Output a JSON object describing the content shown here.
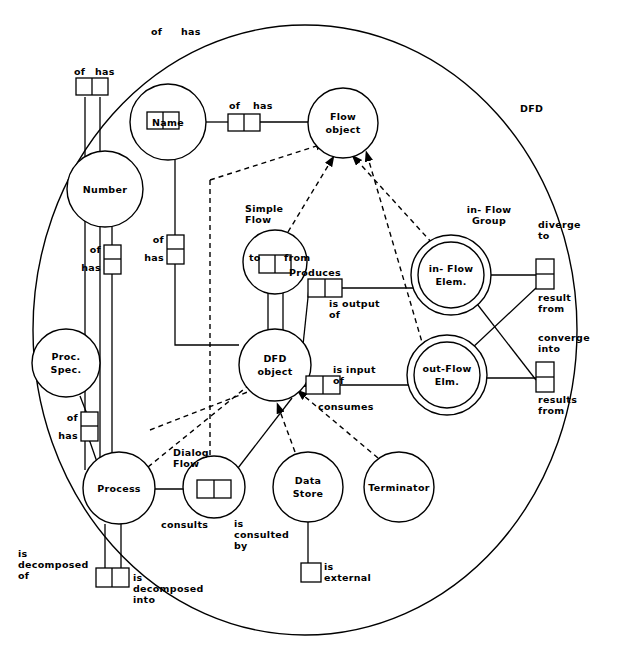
{
  "diagram": {
    "title": "DFD",
    "outer_label": "DFD",
    "entities": [
      {
        "id": "name",
        "label": "Name",
        "cx": 168,
        "cy": 122,
        "r": 38,
        "double": false
      },
      {
        "id": "number",
        "label": "Number",
        "cx": 105,
        "cy": 189,
        "r": 38,
        "double": false
      },
      {
        "id": "flow_object",
        "label": "Flow\nobject",
        "cx": 343,
        "cy": 123,
        "r": 35,
        "double": false
      },
      {
        "id": "simple_flow",
        "label": "to   from",
        "cx": 275,
        "cy": 262,
        "r": 32,
        "double": false
      },
      {
        "id": "dfd_object",
        "label": "DFD\nobject",
        "cx": 275,
        "cy": 365,
        "r": 36,
        "double": false
      },
      {
        "id": "in_flow",
        "label": "in- Flow\nElem.",
        "cx": 451,
        "cy": 275,
        "r": 33,
        "double": true
      },
      {
        "id": "out_flow",
        "label": "out-Flow\nElm.",
        "cx": 447,
        "cy": 375,
        "r": 33,
        "double": true
      },
      {
        "id": "proc_spec",
        "label": "Proc.\nSpec.",
        "cx": 66,
        "cy": 363,
        "r": 34,
        "double": false
      },
      {
        "id": "process",
        "label": "Process",
        "cx": 119,
        "cy": 488,
        "r": 36,
        "double": false
      },
      {
        "id": "dialog_flow",
        "label": "",
        "cx": 214,
        "cy": 487,
        "r": 31,
        "double": false
      },
      {
        "id": "data_store",
        "label": "Data\nStore",
        "cx": 308,
        "cy": 487,
        "r": 35,
        "double": false
      },
      {
        "id": "terminator",
        "label": "Terminator",
        "cx": 399,
        "cy": 487,
        "r": 35,
        "double": false
      }
    ],
    "entity_outside_labels": [
      {
        "id": "lbl_simple_flow",
        "text": "Simple\nFlow",
        "x": 245,
        "y": 203
      },
      {
        "id": "lbl_in_flow_group",
        "text": "in- Flow\nGroup",
        "x": 452,
        "y": 204
      },
      {
        "id": "lbl_dialog_flow",
        "text": "Dialog\nFlow",
        "x": 173,
        "y": 447
      }
    ],
    "relationships": [
      {
        "id": "rel_name_top",
        "roles": [
          "of",
          "has"
        ],
        "orientation": "horizontal",
        "x": 163,
        "y": 120
      },
      {
        "id": "rel_number_top",
        "roles": [
          "of",
          "has"
        ],
        "orientation": "horizontal",
        "x": 92,
        "y": 86
      },
      {
        "id": "rel_name_flow",
        "roles": [
          "of",
          "has"
        ],
        "orientation": "horizontal",
        "x": 243,
        "y": 122
      },
      {
        "id": "rel_number_has",
        "roles": [
          "of",
          "has"
        ],
        "orientation": "vertical",
        "x": 119,
        "y": 258
      },
      {
        "id": "rel_name_has",
        "roles": [
          "of",
          "has"
        ],
        "orientation": "vertical",
        "x": 175,
        "y": 248
      },
      {
        "id": "rel_proc_spec",
        "roles": [
          "of",
          "has"
        ],
        "orientation": "vertical",
        "x": 89,
        "y": 425
      },
      {
        "id": "rel_to_from",
        "roles": [
          "to",
          "from"
        ],
        "orientation": "horizontal",
        "x": 275,
        "y": 262
      },
      {
        "id": "rel_produces",
        "roles": [
          "Produces",
          "is output of"
        ],
        "orientation": "horizontal",
        "x": 325,
        "y": 288
      },
      {
        "id": "rel_consumes",
        "roles": [
          "is input of",
          "consumes"
        ],
        "orientation": "horizontal",
        "x": 322,
        "y": 385
      },
      {
        "id": "rel_diverge",
        "roles": [
          "diverge to",
          "result from"
        ],
        "orientation": "vertical",
        "x": 548,
        "y": 273
      },
      {
        "id": "rel_converge",
        "roles": [
          "converge into",
          "results from"
        ],
        "orientation": "vertical",
        "x": 544,
        "y": 375
      },
      {
        "id": "rel_consults",
        "roles": [
          "consults",
          "is consulted by"
        ],
        "orientation": "horizontal",
        "x": 214,
        "y": 489
      },
      {
        "id": "rel_decomposed",
        "roles": [
          "is decomposed of",
          "is decomposed into"
        ],
        "orientation": "horizontal",
        "x": 112,
        "y": 578
      },
      {
        "id": "rel_is_external",
        "roles": [
          "is external"
        ],
        "orientation": "single",
        "x": 314,
        "y": 573
      }
    ],
    "role_labels": [
      {
        "id": "role_of_1",
        "text": "of",
        "x": 151,
        "y": 31
      },
      {
        "id": "role_has_1",
        "text": "has",
        "x": 187,
        "y": 31
      },
      {
        "id": "role_of_2",
        "text": "of",
        "x": 76,
        "y": 68
      },
      {
        "id": "role_has_2",
        "text": "has",
        "x": 100,
        "y": 68
      },
      {
        "id": "role_of_3",
        "text": "of",
        "x": 234,
        "y": 103
      },
      {
        "id": "role_has_3",
        "text": "has",
        "x": 262,
        "y": 103
      },
      {
        "id": "role_of_4",
        "text": "of",
        "x": 102,
        "y": 250
      },
      {
        "id": "role_has_4",
        "text": "has",
        "x": 101,
        "y": 268
      },
      {
        "id": "role_of_5",
        "text": "of",
        "x": 158,
        "y": 240
      },
      {
        "id": "role_has_5",
        "text": "has",
        "x": 157,
        "y": 258
      },
      {
        "id": "role_of_6",
        "text": "of",
        "x": 71,
        "y": 418
      },
      {
        "id": "role_has_6",
        "text": "has",
        "x": 70,
        "y": 436
      },
      {
        "id": "role_to",
        "text": "to",
        "x": 259,
        "y": 258
      },
      {
        "id": "role_from",
        "text": "from",
        "x": 292,
        "y": 258
      },
      {
        "id": "role_produces",
        "text": "Produces",
        "x": 326,
        "y": 273
      },
      {
        "id": "role_is_output_of",
        "text": "is output\nof",
        "x": 360,
        "y": 303
      },
      {
        "id": "role_is_input_of",
        "text": "is input\nof",
        "x": 359,
        "y": 369
      },
      {
        "id": "role_consumes",
        "text": "consumes",
        "x": 324,
        "y": 407
      },
      {
        "id": "role_diverge_to",
        "text": "diverge\nto",
        "x": 552,
        "y": 224
      },
      {
        "id": "role_result_from",
        "text": "result\nfrom",
        "x": 553,
        "y": 297
      },
      {
        "id": "role_converge_into",
        "text": "converge\ninto",
        "x": 553,
        "y": 337
      },
      {
        "id": "role_results_from",
        "text": "results\nfrom",
        "x": 553,
        "y": 399
      },
      {
        "id": "role_consults",
        "text": "consults",
        "x": 193,
        "y": 524
      },
      {
        "id": "role_is_consulted_by",
        "text": "is\nconsulted\nby",
        "x": 235,
        "y": 522
      },
      {
        "id": "role_is_decomposed_of",
        "text": "is\ndecomposed\nof",
        "x": 73,
        "y": 553
      },
      {
        "id": "role_is_decomposed_into",
        "text": "is\ndecomposed\ninto",
        "x": 133,
        "y": 576
      },
      {
        "id": "role_is_external",
        "text": "is\nexternal",
        "x": 327,
        "y": 566
      }
    ],
    "colors": {
      "line": "#000000",
      "background": "#ffffff",
      "text": "#000000"
    }
  }
}
